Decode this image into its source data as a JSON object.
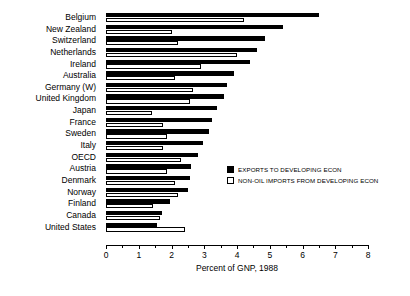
{
  "chart_data": {
    "type": "bar",
    "orientation": "horizontal",
    "title": "",
    "xlabel": "Percent of GNP, 1988",
    "ylabel": "",
    "xlim": [
      0,
      8
    ],
    "xticks": [
      0,
      1,
      2,
      3,
      4,
      5,
      6,
      7,
      8
    ],
    "xtick_labels": [
      "0",
      "1",
      "2",
      "3",
      "4",
      "5",
      "6",
      "7",
      "8"
    ],
    "grid": false,
    "legend_position": "center-right",
    "categories": [
      "Belgium",
      "New Zealand",
      "Switzerland",
      "Netherlands",
      "Ireland",
      "Australia",
      "Germany (W)",
      "United Kingdom",
      "Japan",
      "France",
      "Sweden",
      "Italy",
      "OECD",
      "Austria",
      "Denmark",
      "Norway",
      "Finland",
      "Canada",
      "United States"
    ],
    "series": [
      {
        "name": "EXPORTS TO DEVELOPING ECON",
        "color": "#000000",
        "values": [
          6.5,
          5.4,
          4.85,
          4.6,
          4.4,
          3.9,
          3.7,
          3.6,
          3.4,
          3.25,
          3.15,
          2.95,
          2.8,
          2.6,
          2.55,
          2.5,
          1.95,
          1.7,
          1.55
        ]
      },
      {
        "name": "NON-OIL IMPORTS FROM DEVELOPING ECON",
        "color": "#ffffff",
        "values": [
          4.2,
          2.0,
          2.2,
          4.0,
          2.9,
          2.1,
          2.65,
          2.55,
          1.4,
          1.75,
          1.85,
          1.75,
          2.3,
          1.85,
          2.1,
          2.2,
          1.45,
          1.65,
          2.4
        ]
      }
    ]
  }
}
